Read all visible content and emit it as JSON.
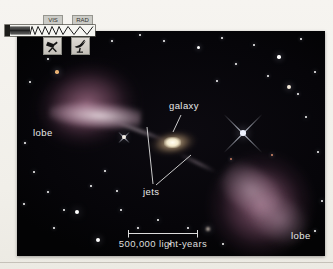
{
  "figure": {
    "type": "annotated radio-galaxy photograph",
    "annotations": {
      "galaxy_label": "galaxy",
      "jets_label": "jets",
      "lobe_left_label": "lobe",
      "lobe_right_label": "lobe",
      "scale_label": "500,000 light-years"
    },
    "colors": {
      "photo_background": "#07060a",
      "lobe": "#8e6078",
      "lobe_highlight": "#f2e4ea",
      "galaxy_core": "#fffdf2",
      "label_text": "#e9e9e9",
      "legend_box": "#cbcbc6",
      "vis_pointer": "#8a7a30"
    }
  },
  "legend": {
    "vis_label": "VIS",
    "rad_label": "RAD",
    "icons": [
      "optical-telescope-icon",
      "radio-dish-icon"
    ],
    "description_icons": "electromagnetic-spectrum-waves"
  },
  "stars": [
    {
      "x": 95,
      "y": 10,
      "r": 1
    },
    {
      "x": 123,
      "y": 4,
      "r": 1.3
    },
    {
      "x": 147,
      "y": 10,
      "r": 1
    },
    {
      "x": 181,
      "y": 16,
      "r": 1.5
    },
    {
      "x": 205,
      "y": 7,
      "r": 1
    },
    {
      "x": 237,
      "y": 14,
      "r": 1.2
    },
    {
      "x": 262,
      "y": 26,
      "r": 1.7
    },
    {
      "x": 284,
      "y": 8,
      "r": 1
    },
    {
      "x": 298,
      "y": 41,
      "r": 1.3
    },
    {
      "x": 272,
      "y": 56,
      "r": 1.9,
      "c": "#f2e8d8"
    },
    {
      "x": 289,
      "y": 86,
      "r": 1.4
    },
    {
      "x": 301,
      "y": 121,
      "r": 1.2
    },
    {
      "x": 251,
      "y": 45,
      "r": 1
    },
    {
      "x": 219,
      "y": 33,
      "r": 1
    },
    {
      "x": 200,
      "y": 50,
      "r": 1.1
    },
    {
      "x": 61,
      "y": 12,
      "r": 1
    },
    {
      "x": 31,
      "y": 28,
      "r": 1
    },
    {
      "x": 13,
      "y": 51,
      "r": 1.2
    },
    {
      "x": 40,
      "y": 41,
      "r": 1.7,
      "c": "#e9b273"
    },
    {
      "x": 8,
      "y": 112,
      "r": 1
    },
    {
      "x": 17,
      "y": 141,
      "r": 1.3
    },
    {
      "x": 31,
      "y": 161,
      "r": 1
    },
    {
      "x": 7,
      "y": 173,
      "r": 1
    },
    {
      "x": 47,
      "y": 179,
      "r": 1.2
    },
    {
      "x": 60,
      "y": 181,
      "r": 2.4,
      "c": "#ffffff"
    },
    {
      "x": 37,
      "y": 197,
      "r": 1
    },
    {
      "x": 81,
      "y": 209,
      "r": 2.0
    },
    {
      "x": 104,
      "y": 179,
      "r": 1.2
    },
    {
      "x": 121,
      "y": 197,
      "r": 1
    },
    {
      "x": 141,
      "y": 189,
      "r": 1.4
    },
    {
      "x": 153,
      "y": 213,
      "r": 1
    },
    {
      "x": 171,
      "y": 197,
      "r": 1.2
    },
    {
      "x": 191,
      "y": 198,
      "r": 1.7,
      "c": "#c9bdb2",
      "fz": 1
    },
    {
      "x": 206,
      "y": 213,
      "r": 1.2
    },
    {
      "x": 88,
      "y": 140,
      "r": 1
    },
    {
      "x": 74,
      "y": 155,
      "r": 1
    },
    {
      "x": 100,
      "y": 160,
      "r": 1.1
    },
    {
      "x": 226,
      "y": 102,
      "r": 2.8,
      "c": "#eef2ff",
      "sp": 27
    },
    {
      "x": 107,
      "y": 106,
      "r": 1.9,
      "c": "#f2ece4",
      "sp": 8
    },
    {
      "x": 255,
      "y": 124,
      "r": 1.1,
      "c": "#d98b6a"
    },
    {
      "x": 214,
      "y": 128,
      "r": 1,
      "c": "#c97b5f"
    },
    {
      "x": 305,
      "y": 170,
      "r": 1.2
    },
    {
      "x": 298,
      "y": 200,
      "r": 1
    },
    {
      "x": 281,
      "y": 63,
      "r": 1
    }
  ]
}
